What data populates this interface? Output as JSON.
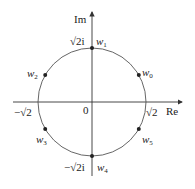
{
  "diagram": {
    "type": "complex-plane-roots-of-unity",
    "axes": {
      "real_label": "Re",
      "imag_label": "Im",
      "origin_label": "0"
    },
    "circle": {
      "center": [
        92,
        102
      ],
      "radius": 54,
      "stroke": "#555555"
    },
    "axis_ticks": {
      "pos_real": "√2",
      "neg_real": "−√2",
      "pos_imag": "√2i",
      "neg_imag": "−√2i"
    },
    "points": [
      {
        "id": "w0",
        "base": "w",
        "sub": "0",
        "angle_deg": 30
      },
      {
        "id": "w1",
        "base": "w",
        "sub": "1",
        "angle_deg": 90
      },
      {
        "id": "w2",
        "base": "w",
        "sub": "2",
        "angle_deg": 150
      },
      {
        "id": "w3",
        "base": "w",
        "sub": "3",
        "angle_deg": 210
      },
      {
        "id": "w4",
        "base": "w",
        "sub": "4",
        "angle_deg": 270
      },
      {
        "id": "w5",
        "base": "w",
        "sub": "5",
        "angle_deg": 330
      }
    ],
    "colors": {
      "axis": "#333333",
      "point": "#222222",
      "text": "#222222"
    }
  }
}
